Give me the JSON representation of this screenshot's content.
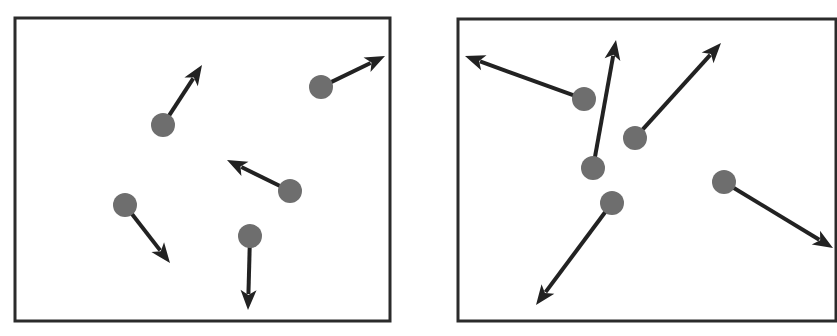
{
  "colors": {
    "background": "#ffffff",
    "frame": "#2b2b2b",
    "particle": "#6e6e6e",
    "arrow": "#222222"
  },
  "panels": [
    {
      "name": "low-energy-panel",
      "frame": {
        "x": 15,
        "y": 18,
        "w": 375,
        "h": 303
      },
      "particles": [
        {
          "cx": 163,
          "cy": 125,
          "r": 12,
          "tip": [
            202,
            65
          ]
        },
        {
          "cx": 321,
          "cy": 87,
          "r": 12,
          "tip": [
            385,
            56
          ]
        },
        {
          "cx": 290,
          "cy": 191,
          "r": 12,
          "tip": [
            227,
            160
          ]
        },
        {
          "cx": 125,
          "cy": 205,
          "r": 12,
          "tip": [
            170,
            263
          ]
        },
        {
          "cx": 250,
          "cy": 236,
          "r": 12,
          "tip": [
            248,
            310
          ]
        }
      ]
    },
    {
      "name": "high-energy-panel",
      "frame": {
        "x": 458,
        "y": 19,
        "w": 378,
        "h": 302
      },
      "particles": [
        {
          "cx": 584,
          "cy": 99,
          "r": 12,
          "tip": [
            465,
            56
          ]
        },
        {
          "cx": 593,
          "cy": 168,
          "r": 12,
          "tip": [
            616,
            40
          ]
        },
        {
          "cx": 635,
          "cy": 138,
          "r": 12,
          "tip": [
            721,
            43
          ]
        },
        {
          "cx": 612,
          "cy": 203,
          "r": 12,
          "tip": [
            536,
            305
          ]
        },
        {
          "cx": 724,
          "cy": 182,
          "r": 12,
          "tip": [
            833,
            248
          ]
        }
      ]
    }
  ]
}
